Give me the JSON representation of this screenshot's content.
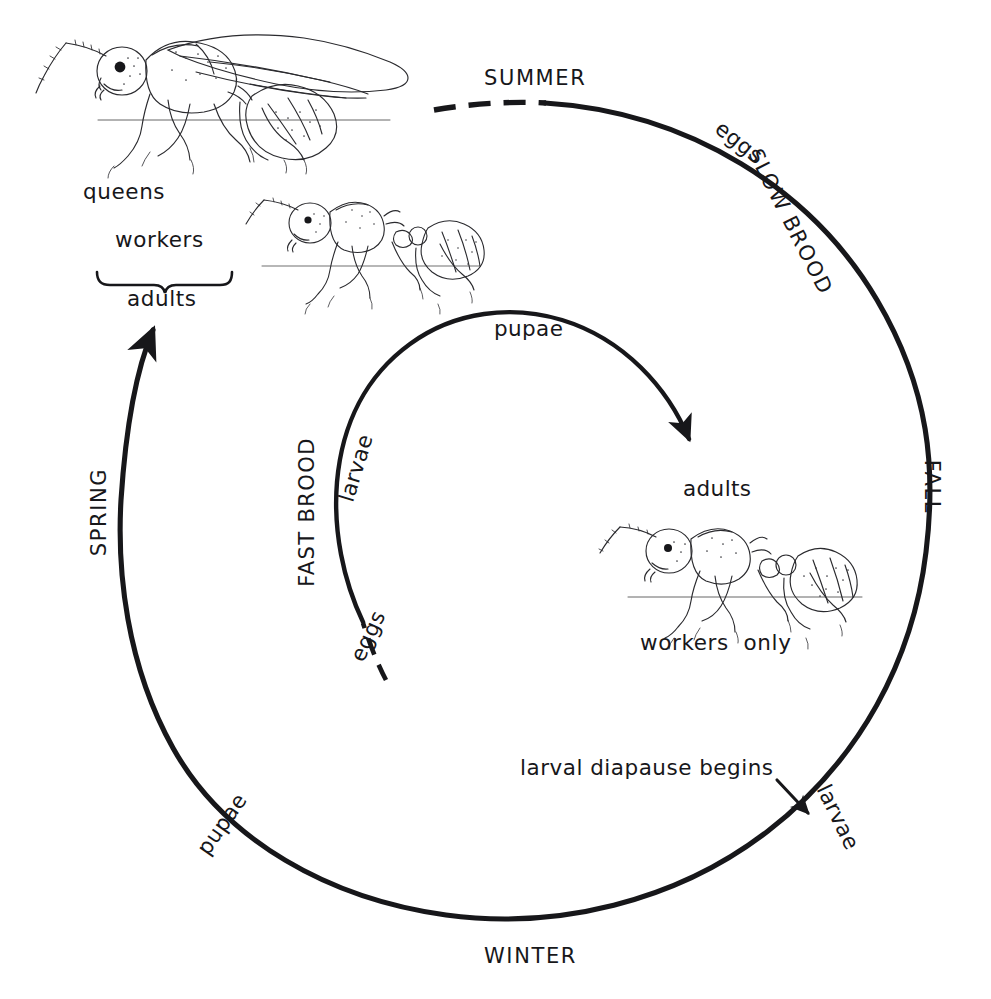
{
  "figure": {
    "kind": "annual-cycle-spiral-diagram",
    "line_color": "#17171a",
    "background": "#ffffff"
  },
  "outer_cycle": {
    "name": "outer annual spiral",
    "seasons": [
      {
        "id": "summer",
        "label": "SUMMER",
        "position": "top"
      },
      {
        "id": "fall",
        "label": "FALL",
        "position": "right"
      },
      {
        "id": "winter",
        "label": "WINTER",
        "position": "bottom"
      },
      {
        "id": "spring",
        "label": "SPRING",
        "position": "left"
      }
    ],
    "brood_label": "SLOW BROOD",
    "stages": [
      {
        "id": "outer-eggs",
        "label": "eggs",
        "position": "upper-right"
      },
      {
        "id": "outer-larvae",
        "label": "larvae",
        "position": "lower-right"
      },
      {
        "id": "outer-pupae",
        "label": "pupae",
        "position": "lower-left"
      },
      {
        "id": "outer-adults",
        "label": "adults",
        "position": "upper-left"
      }
    ],
    "annotation": {
      "id": "diapause",
      "label": "larval diapause begins"
    }
  },
  "inner_cycle": {
    "name": "inner fast-brood spiral",
    "brood_label": "FAST BROOD",
    "stages": [
      {
        "id": "inner-eggs",
        "label": "eggs",
        "position": "lower-left"
      },
      {
        "id": "inner-larvae",
        "label": "larvae",
        "position": "left"
      },
      {
        "id": "inner-pupae",
        "label": "pupae",
        "position": "top"
      },
      {
        "id": "inner-adults",
        "label": "adults",
        "position": "right"
      }
    ]
  },
  "castes": {
    "brace_group_label": "adults",
    "members": [
      {
        "id": "queens",
        "label": "queens"
      },
      {
        "id": "workers",
        "label": "workers"
      }
    ],
    "worker_only_label": "workers  only"
  },
  "illustrations": [
    {
      "id": "winged-queen-ant",
      "label": "queens",
      "position": "top-left"
    },
    {
      "id": "worker-ant-upper",
      "label": "workers",
      "position": "upper-middle"
    },
    {
      "id": "worker-ant-lower",
      "label": "workers  only",
      "position": "middle-right"
    }
  ]
}
